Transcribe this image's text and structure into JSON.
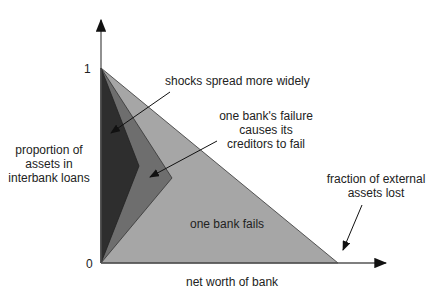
{
  "axes": {
    "y_max_label": "1",
    "origin_label": "0",
    "y_label": "proportion of\nassets in\ninterbank loans",
    "x_label": "net worth of bank"
  },
  "regions": [
    {
      "name": "one bank fails",
      "color": "#a6a6a6"
    },
    {
      "name": "one bank's failure causes its creditors to fail",
      "color": "#6e6e6e"
    },
    {
      "name": "shocks spread more widely",
      "color": "#2e2e2e"
    }
  ],
  "annotations": {
    "shocks": "shocks spread more widely",
    "creditors": "one bank's failure\ncauses its\ncreditors to fail",
    "one_bank": "one bank fails",
    "external": "fraction of external\nassets lost"
  }
}
